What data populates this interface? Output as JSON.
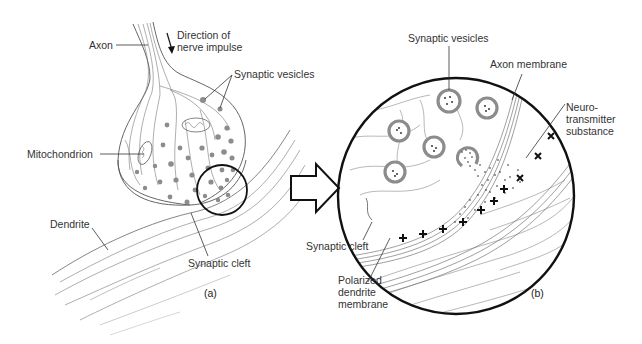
{
  "figure": {
    "panel_a": {
      "caption": "(a)",
      "labels": {
        "axon": "Axon",
        "direction": "Direction of\nnerve impulse",
        "synaptic_vesicles": "Synaptic vesicles",
        "mitochondrion": "Mitochondrion",
        "dendrite": "Dendrite",
        "synaptic_cleft": "Synaptic cleft"
      }
    },
    "panel_b": {
      "caption": "(b)",
      "labels": {
        "synaptic_vesicles": "Synaptic vesicles",
        "axon_membrane": "Axon membrane",
        "neurotransmitter": "Neuro-\ntransmitter\nsubstance",
        "synaptic_cleft": "Synaptic cleft",
        "polarized_membrane": "Polarized\ndendrite\nmembrane"
      }
    },
    "arrow": "zoom-in-arrow",
    "colors": {
      "line": "#222222",
      "fine_line": "#8a8a8a",
      "vesicle_fill": "#8c8c8c",
      "text": "#333333"
    }
  }
}
